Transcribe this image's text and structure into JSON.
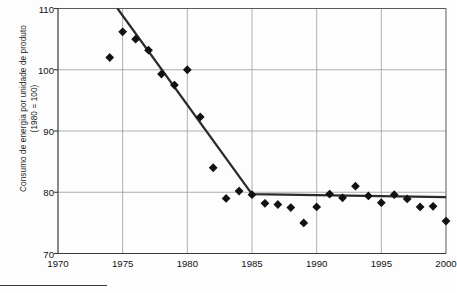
{
  "chart_data": {
    "type": "scatter",
    "title": "",
    "subtitle": "",
    "xlabel": "",
    "ylabel": "Consumo de energia por unidade de produto\n(1980 = 100)",
    "xlim": [
      1970,
      2000
    ],
    "ylim": [
      70,
      110
    ],
    "xticks": [
      1970,
      1975,
      1980,
      1985,
      1990,
      1995,
      2000
    ],
    "yticks": [
      70,
      80,
      90,
      100,
      110
    ],
    "grid": true,
    "legend": null,
    "marker": "diamond",
    "marker_color": "#111111",
    "line_color": "#2b2b2b",
    "x": [
      1974,
      1975,
      1976,
      1977,
      1978,
      1979,
      1980,
      1981,
      1982,
      1983,
      1984,
      1985,
      1986,
      1987,
      1988,
      1989,
      1990,
      1991,
      1992,
      1993,
      1994,
      1995,
      1996,
      1997,
      1998,
      1999,
      2000
    ],
    "values": [
      102.0,
      106.2,
      105.0,
      103.2,
      99.3,
      97.5,
      100.0,
      92.3,
      84.0,
      79.0,
      80.2,
      79.6,
      78.2,
      78.0,
      77.5,
      75.0,
      77.6,
      79.7,
      79.1,
      81.0,
      79.4,
      78.3,
      79.6,
      78.9,
      77.6,
      77.7,
      75.3
    ],
    "series": [
      {
        "name": "Consumo de energia por unidade de produto",
        "points": [
          {
            "x": 1974,
            "y": 102.0
          },
          {
            "x": 1975,
            "y": 106.2
          },
          {
            "x": 1976,
            "y": 105.0
          },
          {
            "x": 1977,
            "y": 103.2
          },
          {
            "x": 1978,
            "y": 99.3
          },
          {
            "x": 1979,
            "y": 97.5
          },
          {
            "x": 1980,
            "y": 100.0
          },
          {
            "x": 1981,
            "y": 92.3
          },
          {
            "x": 1982,
            "y": 84.0
          },
          {
            "x": 1983,
            "y": 79.0
          },
          {
            "x": 1984,
            "y": 80.2
          },
          {
            "x": 1985,
            "y": 79.6
          },
          {
            "x": 1986,
            "y": 78.2
          },
          {
            "x": 1987,
            "y": 78.0
          },
          {
            "x": 1988,
            "y": 77.5
          },
          {
            "x": 1989,
            "y": 75.0
          },
          {
            "x": 1990,
            "y": 77.6
          },
          {
            "x": 1991,
            "y": 79.7
          },
          {
            "x": 1992,
            "y": 79.1
          },
          {
            "x": 1993,
            "y": 81.0
          },
          {
            "x": 1994,
            "y": 79.4
          },
          {
            "x": 1995,
            "y": 78.3
          },
          {
            "x": 1996,
            "y": 79.6
          },
          {
            "x": 1997,
            "y": 78.9
          },
          {
            "x": 1998,
            "y": 77.6
          },
          {
            "x": 1999,
            "y": 77.7
          },
          {
            "x": 2000,
            "y": 75.3
          }
        ]
      }
    ],
    "trend_line": {
      "name": "segmented trend",
      "segments": [
        {
          "x0": 1974.6,
          "y0": 110.0,
          "x1": 1985.0,
          "y1": 79.7
        },
        {
          "x0": 1985.0,
          "y1": 79.2,
          "x2": 2000.0,
          "y0": 79.7,
          "x1": 2000.0
        }
      ],
      "vertices": [
        {
          "x": 1974.6,
          "y": 110.0
        },
        {
          "x": 1985.0,
          "y": 79.7
        },
        {
          "x": 2000.0,
          "y": 79.2
        }
      ]
    }
  }
}
